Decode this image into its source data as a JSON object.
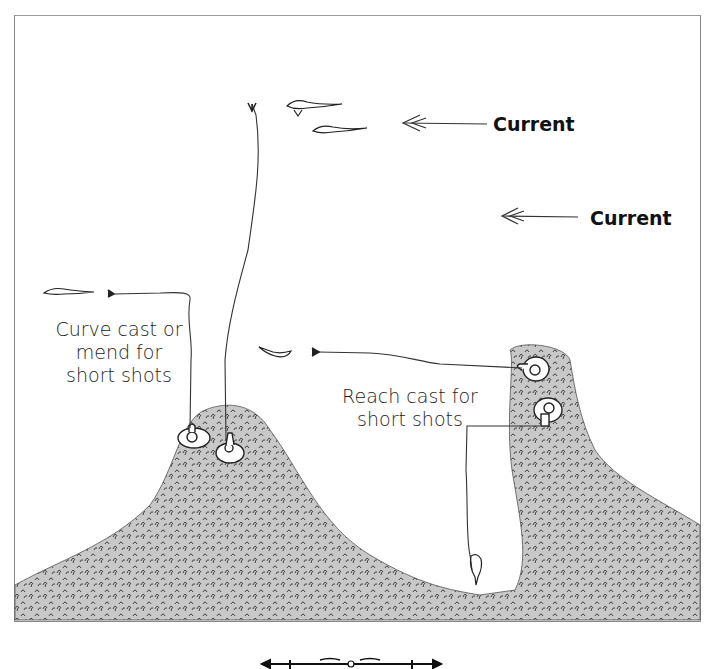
{
  "diagram": {
    "heading_partial": "",
    "current_labels": [
      "Current",
      "Current"
    ],
    "annotations": {
      "curve_cast": [
        "Curve cast or",
        "mend for",
        "short shots"
      ],
      "reach_cast": [
        "Reach cast for",
        "short shots"
      ]
    },
    "icons": {
      "fish": "fish-icon",
      "arrow": "arrow-left-icon",
      "angler": "angler-icon",
      "fly": "fly-icon",
      "rod_ornament": "rod-ornament-icon"
    },
    "colors": {
      "ink": "#222222",
      "frame": "#8a8a8a",
      "grass_fill": "#bdbdbd",
      "background": "#ffffff"
    }
  }
}
